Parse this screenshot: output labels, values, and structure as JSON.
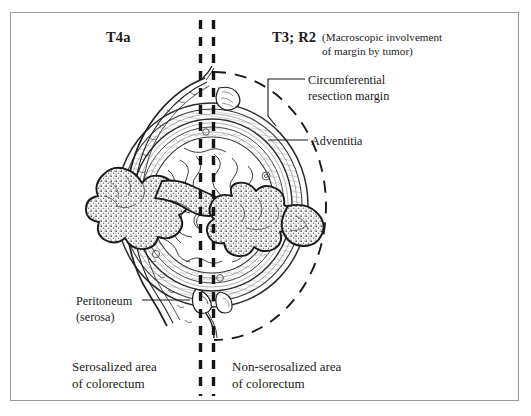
{
  "figure": {
    "domain": "medical-illustration",
    "title_left": "T4a",
    "title_right": "T3; R2",
    "right_note": "(Macroscopic involvement\nof margin by tumor)",
    "background_color": "#ffffff",
    "frame_color": "#9a9a9a",
    "ink_color": "#1a1a1a"
  },
  "labels": {
    "t4a": "T4a",
    "t3_r2": "T3; R2",
    "macroscopic_note": "(Macroscopic involvement\nof margin by tumor)",
    "circumferential_resection_margin": "Circumferential\nresection margin",
    "adventitia": "Adventitia",
    "peritoneum": "Peritoneum\n(serosa)",
    "serosalized_area": "Serosalized area\nof colorectum",
    "non_serosalized_area": "Non-serosalized area\nof colorectum"
  },
  "anatomy": {
    "structures": [
      "bowel-cross-section",
      "mucosa",
      "submucosa",
      "muscularis-propria",
      "peritoneum-serosa",
      "adventitia",
      "tumor-mass-left",
      "tumor-mass-right"
    ],
    "markers": [
      "vertical-dashed-divider-left",
      "vertical-dashed-divider-right",
      "circumferential-resection-margin-ellipse"
    ]
  }
}
